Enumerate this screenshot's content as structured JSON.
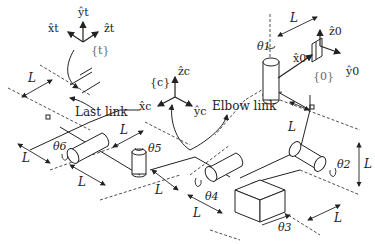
{
  "diagram": {
    "frames": {
      "tool": {
        "name": "{t}",
        "x": "x̂t",
        "y": "ŷt",
        "z": "ẑt"
      },
      "camera": {
        "name": "{c}",
        "x": "x̂c",
        "y": "ŷc",
        "z": "ẑc"
      },
      "base": {
        "name": "{0}",
        "x": "x̂0",
        "y": "ŷ0",
        "z": "ẑ0"
      }
    },
    "labels": {
      "last_link": "Last link",
      "elbow_link": "Elbow link"
    },
    "joints": [
      "θ1",
      "θ2",
      "θ3",
      "θ4",
      "θ5",
      "θ6"
    ],
    "length_label": "L"
  }
}
